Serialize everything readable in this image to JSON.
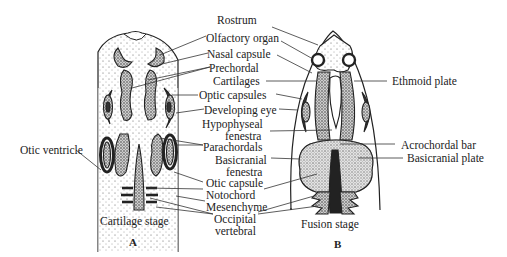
{
  "figure": {
    "panels": [
      {
        "id": "A",
        "letter": "A",
        "caption": "Cartilage stage"
      },
      {
        "id": "B",
        "letter": "B",
        "caption": "Fusion stage"
      }
    ],
    "labels": {
      "rostrum": "Rostrum",
      "olfactory_organ": "Olfactory organ",
      "nasal_capsule": "Nasal capsule",
      "prechordal_1": "Prechordal",
      "prechordal_2": "Cartilages",
      "optic_capsules": "Optic capsules",
      "developing_eye": "Developing eye",
      "hypophyseal_1": "Hypophyseal",
      "hypophyseal_2": "fenestra",
      "parachordals": "Parachordals",
      "basicranial_1": "Basicranial",
      "basicranial_2": "fenestra",
      "otic_capsule": "Otic capsule",
      "notochord": "Notochord",
      "mesenchyme": "Mesenchyme",
      "occipital_1": "Occipital",
      "occipital_2": "vertebral",
      "otic_ventricle": "Otic ventricle",
      "ethmoid_plate": "Ethmoid plate",
      "acrochordal_bar": "Acrochordal bar",
      "basicranial_plate": "Basicranial plate"
    },
    "colors": {
      "ink": "#222222",
      "cartilage_fill": "#d9d9d9",
      "background": "#ffffff"
    }
  }
}
